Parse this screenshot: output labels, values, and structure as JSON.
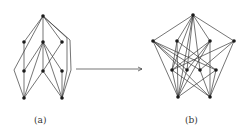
{
  "diagram": {
    "arrow": {
      "from": [
        76,
        69
      ],
      "to": [
        142,
        69
      ]
    },
    "left_graph": {
      "label": "(a)",
      "nodes": [
        {
          "id": "t",
          "x": 43,
          "y": 16
        },
        {
          "id": "a1",
          "x": 24,
          "y": 42
        },
        {
          "id": "a2",
          "x": 43,
          "y": 42
        },
        {
          "id": "a3",
          "x": 62,
          "y": 42
        },
        {
          "id": "b1",
          "x": 24,
          "y": 71
        },
        {
          "id": "b2",
          "x": 43,
          "y": 71
        },
        {
          "id": "b3",
          "x": 62,
          "y": 71
        },
        {
          "id": "c1",
          "x": 24,
          "y": 98
        },
        {
          "id": "c2",
          "x": 62,
          "y": 98
        }
      ],
      "edges": [
        [
          "t",
          "a1"
        ],
        [
          "t",
          "a2"
        ],
        [
          "t",
          "a3"
        ],
        [
          "a1",
          "b1"
        ],
        [
          "a2",
          "b1"
        ],
        [
          "a2",
          "b2"
        ],
        [
          "a2",
          "b3"
        ],
        [
          "a3",
          "b2"
        ],
        [
          "b1",
          "c1"
        ],
        [
          "a2",
          "c1"
        ],
        [
          "b2",
          "c2"
        ],
        [
          "a2",
          "c2"
        ],
        [
          "b3",
          "c2"
        ],
        [
          "b2",
          "c1"
        ]
      ],
      "curved_edges": [
        {
          "path": "M43,16 L14,70 L24,98"
        },
        {
          "path": "M43,16 L70,40 L71,70 L62,98"
        },
        {
          "path": "M43,16 L67,38 L67,70 L62,98"
        }
      ]
    },
    "right_graph": {
      "label": "(b)",
      "nodes": [
        {
          "id": "t",
          "x": 193,
          "y": 15
        },
        {
          "id": "a1",
          "x": 153,
          "y": 41
        },
        {
          "id": "a2",
          "x": 177,
          "y": 41
        },
        {
          "id": "a3",
          "x": 210,
          "y": 41
        },
        {
          "id": "a4",
          "x": 234,
          "y": 41
        },
        {
          "id": "b1",
          "x": 172,
          "y": 70
        },
        {
          "id": "b2",
          "x": 187,
          "y": 70
        },
        {
          "id": "b3",
          "x": 200,
          "y": 70
        },
        {
          "id": "b4",
          "x": 216,
          "y": 70
        },
        {
          "id": "c1",
          "x": 178,
          "y": 97
        },
        {
          "id": "c2",
          "x": 210,
          "y": 97
        }
      ],
      "edges": [
        [
          "t",
          "a1"
        ],
        [
          "t",
          "a2"
        ],
        [
          "t",
          "a3"
        ],
        [
          "t",
          "a4"
        ],
        [
          "t",
          "b1"
        ],
        [
          "t",
          "b2"
        ],
        [
          "t",
          "b3"
        ],
        [
          "t",
          "c1"
        ],
        [
          "a1",
          "b2"
        ],
        [
          "a1",
          "b3"
        ],
        [
          "a1",
          "b4"
        ],
        [
          "a1",
          "c1"
        ],
        [
          "a1",
          "c2"
        ],
        [
          "a2",
          "b1"
        ],
        [
          "a2",
          "b4"
        ],
        [
          "a2",
          "c1"
        ],
        [
          "a3",
          "b1"
        ],
        [
          "a3",
          "b2"
        ],
        [
          "a3",
          "c1"
        ],
        [
          "a3",
          "c2"
        ],
        [
          "a4",
          "b1"
        ],
        [
          "a4",
          "b3"
        ],
        [
          "a4",
          "c2"
        ],
        [
          "b1",
          "c1"
        ],
        [
          "b2",
          "c1"
        ],
        [
          "b3",
          "c2"
        ],
        [
          "b4",
          "c2"
        ],
        [
          "b1",
          "c2"
        ],
        [
          "b4",
          "c1"
        ]
      ]
    }
  }
}
